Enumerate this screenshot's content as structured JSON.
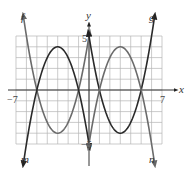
{
  "chart_data": {
    "type": "line",
    "title": "",
    "xlabel": "x",
    "ylabel": "y",
    "xlim": [
      -7,
      7
    ],
    "ylim": [
      -5,
      5
    ],
    "grid": true,
    "x_ticks_labeled": [
      "-7",
      "7"
    ],
    "y_ticks_labeled": [
      "5",
      "-5"
    ],
    "series": [
      {
        "name": "f",
        "color": "#6b6b6b",
        "equation": "y = (x+3)^2 - 4",
        "domain": [
          -6.2,
          0
        ],
        "points": [
          [
            -6,
            5
          ],
          [
            -5,
            0
          ],
          [
            -3,
            -4
          ],
          [
            -1,
            0
          ],
          [
            0,
            5
          ]
        ]
      },
      {
        "name": "m",
        "color": "#2a2a2a",
        "equation": "y = -(x+3)^2 + 4",
        "domain": [
          -6.2,
          0
        ],
        "points": [
          [
            -6,
            -5
          ],
          [
            -5,
            0
          ],
          [
            -3,
            4
          ],
          [
            -1,
            0
          ],
          [
            0,
            -5
          ]
        ]
      },
      {
        "name": "g",
        "color": "#2a2a2a",
        "equation": "y = (x-3)^2 - 4",
        "domain": [
          0,
          6.2
        ],
        "points": [
          [
            0,
            5
          ],
          [
            1,
            0
          ],
          [
            3,
            -4
          ],
          [
            5,
            0
          ],
          [
            6,
            5
          ]
        ]
      },
      {
        "name": "n",
        "color": "#6b6b6b",
        "equation": "y = -(x-3)^2 + 4",
        "domain": [
          0,
          6.2
        ],
        "points": [
          [
            0,
            -5
          ],
          [
            1,
            0
          ],
          [
            3,
            4
          ],
          [
            5,
            0
          ],
          [
            6,
            -5
          ]
        ]
      }
    ],
    "curve_labels": [
      "f",
      "m",
      "g",
      "n"
    ]
  },
  "labels": {
    "x_axis": "x",
    "y_axis": "y",
    "x_min": "−7",
    "x_max": "7",
    "y_max": "5",
    "y_min": "−5",
    "f": "f",
    "m": "m",
    "g": "g",
    "n": "n"
  }
}
